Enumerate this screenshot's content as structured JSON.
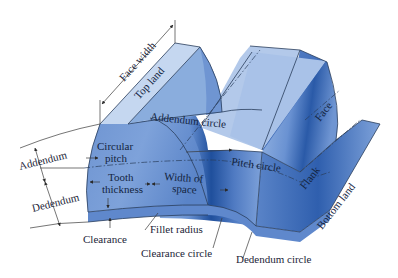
{
  "diagram": {
    "colors": {
      "top_land": "#b9cdec",
      "face_light": "#8fb0e0",
      "face_mid": "#6f95d2",
      "flank_dark": "#3f6cb8",
      "shadow": "#1f4f9c",
      "edge": "#2a3d5c",
      "text": "#1c2538"
    },
    "labels": {
      "face_width": "Face width",
      "top_land": "Top land",
      "addendum_circle": "Addendum circle",
      "addendum": "Addendum",
      "dedendum": "Dedendum",
      "circular_pitch_1": "Circular",
      "circular_pitch_2": "pitch",
      "tooth_thickness_1": "Tooth",
      "tooth_thickness_2": "thickness",
      "width_of_space_1": "Width of",
      "width_of_space_2": "space",
      "pitch_circle": "Pitch circle",
      "face": "Face",
      "flank": "Flank",
      "bottom_land": "Bottom land",
      "clearance": "Clearance",
      "fillet_radius": "Fillet radius",
      "clearance_circle": "Clearance circle",
      "dedendum_circle": "Dedendum circle"
    }
  }
}
